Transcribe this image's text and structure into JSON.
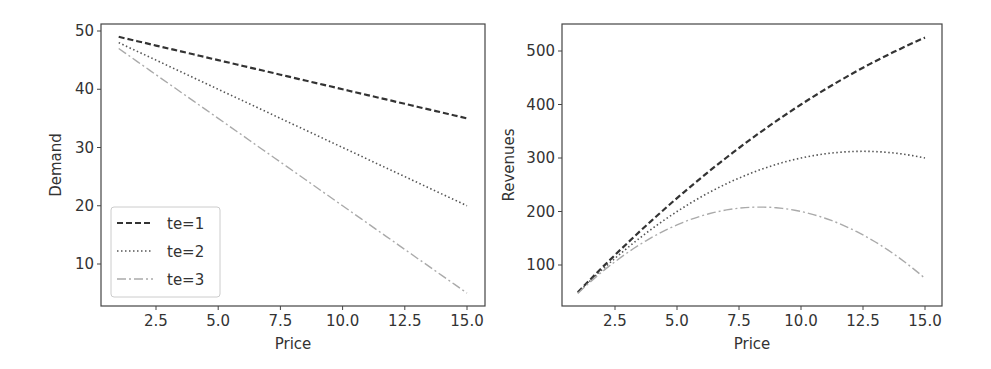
{
  "chart_data": [
    {
      "type": "line",
      "title": "",
      "xlabel": "Price",
      "ylabel": "Demand",
      "xlim": [
        0.3,
        15.7
      ],
      "ylim": [
        2.75,
        52.25
      ],
      "xticks": [
        "2.5",
        "5.0",
        "7.5",
        "10.0",
        "12.5",
        "15.0"
      ],
      "yticks": [
        "10",
        "20",
        "30",
        "40",
        "50"
      ],
      "grid": false,
      "legend_position": "lower left",
      "x": [
        1,
        15
      ],
      "series": [
        {
          "name": "te=1",
          "style": "dashed",
          "color": "#333333",
          "values": [
            49,
            35
          ]
        },
        {
          "name": "te=2",
          "style": "dotted",
          "color": "#555555",
          "values": [
            48,
            20
          ]
        },
        {
          "name": "te=3",
          "style": "dashdot",
          "color": "#aaaaaa",
          "values": [
            47,
            5
          ]
        }
      ]
    },
    {
      "type": "line",
      "title": "",
      "xlabel": "Price",
      "ylabel": "Revenues",
      "xlim": [
        0.3,
        15.7
      ],
      "ylim": [
        26.25,
        548.75
      ],
      "xticks": [
        "2.5",
        "5.0",
        "7.5",
        "10.0",
        "12.5",
        "15.0"
      ],
      "yticks": [
        "100",
        "200",
        "300",
        "400",
        "500"
      ],
      "grid": false,
      "x": [
        1,
        2.5,
        5,
        7.5,
        10,
        12.5,
        15
      ],
      "series": [
        {
          "name": "te=1",
          "style": "dashed",
          "color": "#333333",
          "values": [
            49,
            118.75,
            225,
            318.75,
            400,
            468.75,
            525
          ]
        },
        {
          "name": "te=2",
          "style": "dotted",
          "color": "#555555",
          "values": [
            48,
            112.5,
            200,
            262.5,
            300,
            312.5,
            300
          ]
        },
        {
          "name": "te=3",
          "style": "dashdot",
          "color": "#aaaaaa",
          "values": [
            47,
            106.25,
            175,
            206.25,
            200,
            156.25,
            75
          ]
        }
      ]
    }
  ]
}
